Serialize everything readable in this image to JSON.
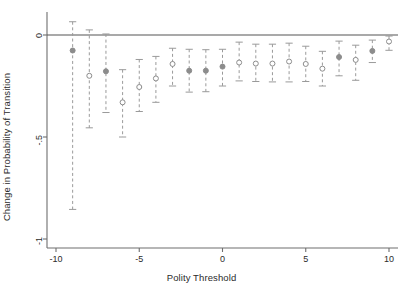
{
  "chart_data": {
    "type": "scatter",
    "title": "",
    "subtitle": "",
    "xlabel": "Polity Threshold",
    "ylabel": "Change in Probability of Transition",
    "xlim": [
      -10.6,
      10.6
    ],
    "ylim": [
      -1.02,
      0.06
    ],
    "xticks": [
      -10,
      -5,
      0,
      5,
      10
    ],
    "xticklabels": [
      "-10",
      "-5",
      "0",
      "5",
      "10"
    ],
    "yticks": [
      0,
      -0.5,
      -1
    ],
    "yticklabels": [
      "0",
      "-.5",
      "-1"
    ],
    "grid": false,
    "legend": null,
    "zero_line": 0,
    "marker_style": "open-circle-with-errorbars",
    "errorbar_style": "dashed-with-caps",
    "series": [
      {
        "name": "Change in Probability of Transition",
        "x": [
          -9,
          -8,
          -7,
          -6,
          -5,
          -4,
          -3,
          -2,
          -1,
          0,
          1,
          2,
          3,
          4,
          5,
          6,
          7,
          8,
          9,
          10
        ],
        "values": [
          -0.076,
          -0.2,
          -0.178,
          -0.33,
          -0.255,
          -0.213,
          -0.142,
          -0.175,
          -0.175,
          -0.155,
          -0.135,
          -0.14,
          -0.14,
          -0.13,
          -0.142,
          -0.165,
          -0.108,
          -0.122,
          -0.078,
          -0.032
        ],
        "ci_low": [
          -0.855,
          -0.455,
          -0.38,
          -0.5,
          -0.375,
          -0.33,
          -0.25,
          -0.28,
          -0.278,
          -0.25,
          -0.225,
          -0.228,
          -0.23,
          -0.23,
          -0.228,
          -0.25,
          -0.2,
          -0.222,
          -0.135,
          -0.075
        ],
        "ci_high": [
          0.065,
          0.025,
          0.005,
          -0.17,
          -0.12,
          -0.105,
          -0.065,
          -0.07,
          -0.072,
          -0.07,
          -0.035,
          -0.045,
          -0.045,
          -0.04,
          -0.055,
          -0.08,
          -0.03,
          -0.05,
          -0.025,
          -0.005
        ],
        "filled": [
          true,
          false,
          true,
          false,
          false,
          false,
          false,
          true,
          true,
          true,
          false,
          false,
          false,
          false,
          false,
          false,
          true,
          false,
          true,
          false
        ]
      }
    ]
  },
  "colors": {
    "marker": "#8c8c8c",
    "errorbar": "#9a9a9a",
    "axis": "#6e6e6e",
    "zero_line": "#555555",
    "text": "#2b2b2b",
    "background": "#ffffff"
  }
}
